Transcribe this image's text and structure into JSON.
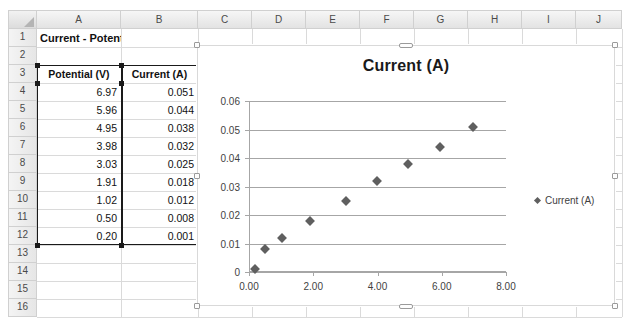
{
  "app": {
    "type": "spreadsheet"
  },
  "grid": {
    "columns": [
      "A",
      "B",
      "C",
      "D",
      "E",
      "F",
      "G",
      "H",
      "I",
      "J"
    ],
    "rows": [
      "1",
      "2",
      "3",
      "4",
      "5",
      "6",
      "7",
      "8",
      "9",
      "10",
      "11",
      "12",
      "13",
      "14",
      "15",
      "16"
    ],
    "title_cell": "Current - Potential Data",
    "headers": {
      "a": "Potential (V)",
      "b": "Current (A)"
    },
    "selection_range": "A3:B12"
  },
  "table": {
    "columns": [
      "Potential (V)",
      "Current (A)"
    ],
    "rows": [
      {
        "row": "4",
        "potential": "6.97",
        "current": "0.051"
      },
      {
        "row": "5",
        "potential": "5.96",
        "current": "0.044"
      },
      {
        "row": "6",
        "potential": "4.95",
        "current": "0.038"
      },
      {
        "row": "7",
        "potential": "3.98",
        "current": "0.032"
      },
      {
        "row": "8",
        "potential": "3.03",
        "current": "0.025"
      },
      {
        "row": "9",
        "potential": "1.91",
        "current": "0.018"
      },
      {
        "row": "10",
        "potential": "1.02",
        "current": "0.012"
      },
      {
        "row": "11",
        "potential": "0.50",
        "current": "0.008"
      },
      {
        "row": "12",
        "potential": "0.20",
        "current": "0.001"
      }
    ]
  },
  "chart_data": {
    "type": "scatter",
    "title": "Current (A)",
    "xlabel": "",
    "ylabel": "",
    "grid": true,
    "legend_position": "right",
    "marker": "diamond",
    "marker_color": "#5f5f5f",
    "series": [
      {
        "name": "Current (A)",
        "x": [
          6.97,
          5.96,
          4.95,
          3.98,
          3.03,
          1.91,
          1.02,
          0.5,
          0.2
        ],
        "y": [
          0.051,
          0.044,
          0.038,
          0.032,
          0.025,
          0.018,
          0.012,
          0.008,
          0.001
        ]
      }
    ],
    "xlim": [
      0,
      8
    ],
    "ylim": [
      0,
      0.06
    ],
    "xticks": [
      "0.00",
      "2.00",
      "4.00",
      "6.00",
      "8.00"
    ],
    "xtick_values": [
      0,
      2,
      4,
      6,
      8
    ],
    "yticks": [
      "0",
      "0.01",
      "0.02",
      "0.03",
      "0.04",
      "0.05",
      "0.06"
    ],
    "ytick_values": [
      0,
      0.01,
      0.02,
      0.03,
      0.04,
      0.05,
      0.06
    ]
  }
}
